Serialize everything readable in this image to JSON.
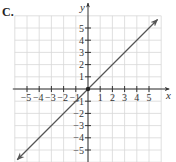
{
  "figure": {
    "label": "C."
  },
  "chart_data": {
    "type": "line",
    "title": "",
    "xlabel": "x",
    "ylabel": "y",
    "xlim": [
      -6,
      6
    ],
    "ylim": [
      -6,
      6
    ],
    "grid": true,
    "x_ticks": [
      -5,
      -4,
      -3,
      -2,
      -1,
      1,
      2,
      3,
      4,
      5
    ],
    "y_ticks": [
      -5,
      -4,
      -3,
      -2,
      -1,
      1,
      2,
      3,
      4,
      5
    ],
    "x_tick_labels": [
      "−5",
      "−4",
      "−3",
      "−2",
      "−1",
      "1",
      "2",
      "3",
      "4",
      "5"
    ],
    "y_tick_labels": [
      "−5",
      "−4",
      "−3",
      "−2",
      "−1",
      "1",
      "2",
      "3",
      "4",
      "5"
    ],
    "series": [
      {
        "name": "y = x",
        "equation": "y = x",
        "x": [
          -5.8,
          0,
          5.7
        ],
        "y": [
          -5.8,
          0,
          5.7
        ],
        "arrows": "both",
        "color": "#555555"
      }
    ],
    "points": [
      {
        "x": 0,
        "y": 0,
        "label": "origin",
        "marker": "dot"
      }
    ]
  },
  "layout": {
    "origin_px": [
      88,
      89
    ],
    "unit_px": 12.2,
    "grid_color": "#d8d8d8",
    "axis_color": "#333333",
    "line_color": "#555555"
  }
}
